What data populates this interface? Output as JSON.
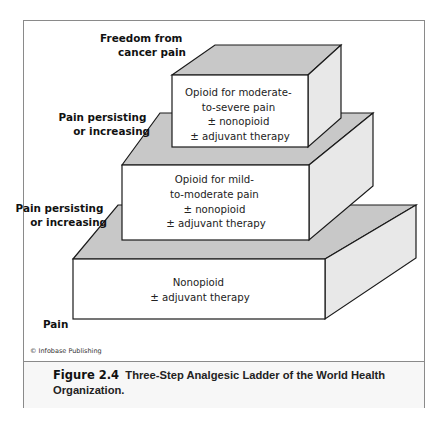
{
  "diagram": {
    "type": "three-step ladder",
    "steps": [
      {
        "level": 1,
        "lines": [
          "Nonopioid",
          "± adjuvant therapy"
        ]
      },
      {
        "level": 2,
        "lines": [
          "Opioid for mild-",
          "to-moderate pain",
          "± nonopioid",
          "± adjuvant therapy"
        ]
      },
      {
        "level": 3,
        "lines": [
          "Opioid for moderate-",
          "to-severe pain",
          "± nonopioid",
          "± adjuvant therapy"
        ]
      }
    ],
    "side_labels": {
      "bottom": [
        "Pain"
      ],
      "step1_to_2": [
        "Pain persisting",
        "or increasing"
      ],
      "step2_to_3": [
        "Pain persisting",
        "or increasing"
      ],
      "top": [
        "Freedom from",
        "cancer pain"
      ]
    },
    "colors": {
      "top_face": "#c8c8c8",
      "side_face": "#e8e8e8",
      "front_face": "#ffffff",
      "outline": "#1a1a1a",
      "frame": "#8a8a8a"
    }
  },
  "credit": "© Infobase Publishing",
  "caption": {
    "figure_label": "Figure 2.4",
    "text": "Three-Step Analgesic Ladder of the World Health Organization."
  }
}
